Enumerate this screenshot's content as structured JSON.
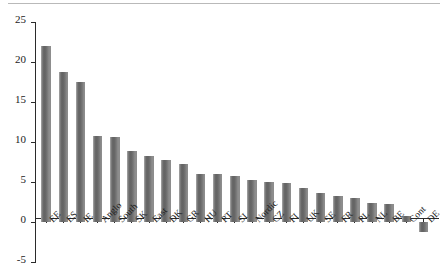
{
  "chart_data": {
    "type": "bar",
    "title": "",
    "subtitle": "",
    "xlabel": "",
    "ylabel": "",
    "ylim": [
      -5,
      25
    ],
    "yticks": [
      -5,
      0,
      5,
      10,
      15,
      20,
      25
    ],
    "ytick_labels": [
      "-5",
      "0",
      "5",
      "10",
      "15",
      "20",
      "25"
    ],
    "grid": false,
    "legend": null,
    "orientation": "vertical",
    "bar_color": "#6f6f6f",
    "axis_color": "#2b2b2b",
    "categories": [
      "EE",
      "ES",
      "IE",
      "Anglo",
      "South",
      "SK",
      "East",
      "DK",
      "GR",
      "HU",
      "PT",
      "SI",
      "Nordic",
      "CZ",
      "FI",
      "UK",
      "SE",
      "FR",
      "PL",
      "NL",
      "BE",
      "Cont",
      "DE"
    ],
    "values": [
      22.0,
      18.7,
      17.5,
      10.7,
      10.6,
      8.9,
      8.3,
      7.7,
      7.3,
      6.0,
      6.0,
      5.8,
      5.3,
      5.0,
      4.9,
      4.3,
      3.6,
      3.2,
      3.0,
      2.4,
      2.2,
      0.7,
      -1.2
    ],
    "series": [
      {
        "name": "value",
        "values": [
          22.0,
          18.7,
          17.5,
          10.7,
          10.6,
          8.9,
          8.3,
          7.7,
          7.3,
          6.0,
          6.0,
          5.8,
          5.3,
          5.0,
          4.9,
          4.3,
          3.6,
          3.2,
          3.0,
          2.4,
          2.2,
          0.7,
          -1.2
        ]
      }
    ]
  }
}
